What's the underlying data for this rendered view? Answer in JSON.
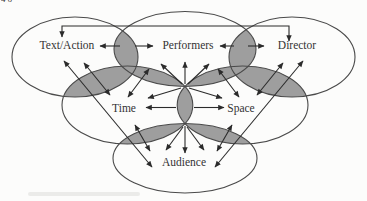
{
  "figure": {
    "corner_fragment": "46",
    "nodes": {
      "text_action": {
        "label": "Text/Action"
      },
      "performers": {
        "label": "Performers"
      },
      "director": {
        "label": "Director"
      },
      "time": {
        "label": "Time"
      },
      "space": {
        "label": "Space"
      },
      "audience": {
        "label": "Audience"
      }
    },
    "connections": [
      "Text/Action <-> Director (top elbow connector)",
      "Text/Action <-> Performers",
      "Performers <-> Director",
      "Time <-> Space",
      "Text/Action <-> Time",
      "Performers <-> Time",
      "Performers <-> Space",
      "Director <-> Space",
      "Time <-> Audience",
      "Space <-> Audience",
      "Text/Action <-> Audience (long diagonal)",
      "Director <-> Audience (long diagonal)",
      "Center intersection -> Performers",
      "Center intersection -> Time",
      "Center intersection -> Space",
      "Center intersection -> Audience"
    ],
    "colors": {
      "bg": "#fcfcfb",
      "ellipse_stroke": "#4a4a4a",
      "overlap_fill": "#9e9e9e",
      "arrow": "#2b2b2b",
      "label_color": "#333333"
    }
  }
}
